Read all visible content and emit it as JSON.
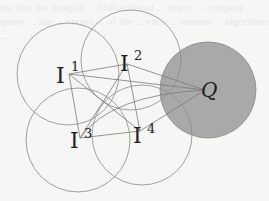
{
  "diagram": {
    "title": "",
    "background_text": "ms that the integral ... bidirectional ... many ... compute ... query ... the ... vertex ... of the ... each ... nearest ... algorithm ...",
    "colors": {
      "background": "#f6f6f4",
      "circle_stroke": "#8a8a8a",
      "query_fill": "#a9a9a9",
      "edge_stroke": "#7a7a7a",
      "label": "#222222"
    },
    "nodes": [
      {
        "id": "I1",
        "base": "I",
        "sup": "1",
        "x": 67,
        "y": 73,
        "circle": {
          "cx": 68,
          "cy": 74,
          "r": 51
        }
      },
      {
        "id": "I2",
        "base": "I",
        "sup": "2",
        "x": 128,
        "y": 63,
        "circle": {
          "cx": 131,
          "cy": 60,
          "r": 50
        }
      },
      {
        "id": "I3",
        "base": "I",
        "sup": "3",
        "x": 80,
        "y": 138,
        "circle": {
          "cx": 78,
          "cy": 140,
          "r": 52
        }
      },
      {
        "id": "I4",
        "base": "I",
        "sup": "4",
        "x": 140,
        "y": 132,
        "circle": {
          "cx": 142,
          "cy": 135,
          "r": 50
        }
      }
    ],
    "query": {
      "id": "Q",
      "label": "Q",
      "x": 208,
      "y": 88,
      "circle": {
        "cx": 208,
        "cy": 90,
        "r": 48
      }
    },
    "edges": [
      [
        "I1",
        "I2"
      ],
      [
        "I1",
        "I3"
      ],
      [
        "I1",
        "I4"
      ],
      [
        "I1",
        "Q"
      ],
      [
        "I2",
        "I3"
      ],
      [
        "I2",
        "I4"
      ],
      [
        "I2",
        "Q"
      ],
      [
        "I3",
        "I4"
      ],
      [
        "I3",
        "Q"
      ],
      [
        "I4",
        "Q"
      ]
    ],
    "labels": {
      "I1": {
        "base": "I",
        "sup": "1"
      },
      "I2": {
        "base": "I",
        "sup": "2"
      },
      "I3": {
        "base": "I",
        "sup": "3"
      },
      "I4": {
        "base": "I",
        "sup": "4"
      },
      "Q": "Q"
    }
  }
}
